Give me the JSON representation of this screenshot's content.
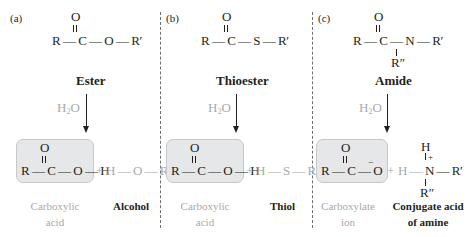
{
  "panels": [
    {
      "label": "(a)",
      "reactant": {
        "formula": "R — C — O — R′",
        "carbonyl_o": "O",
        "name": "Ester"
      },
      "reagent": "H2O",
      "product1": {
        "formula": "R — C — O — H",
        "carbonyl_o": "O",
        "name_line1": "Carboxylic",
        "name_line2": "acid"
      },
      "plus": "+",
      "product2": {
        "formula": "H — O — R′",
        "name": "Alcohol"
      }
    },
    {
      "label": "(b)",
      "reactant": {
        "formula": "R — C — S — R′",
        "carbonyl_o": "O",
        "name": "Thioester"
      },
      "reagent": "H2O",
      "product1": {
        "formula": "R — C — O — H",
        "carbonyl_o": "O",
        "name_line1": "Carboxylic",
        "name_line2": "acid"
      },
      "plus": "+",
      "product2": {
        "formula": "H — S — R′",
        "name": "Thiol"
      }
    },
    {
      "label": "(c)",
      "reactant": {
        "formula": "R — C — N — R′",
        "carbonyl_o": "O",
        "n_sub": "R″",
        "name": "Amide"
      },
      "reagent": "H2O",
      "product1": {
        "formula": "R — C — O",
        "charge": "−",
        "carbonyl_o": "O",
        "name_line1": "Carboxylate",
        "name_line2": "ion"
      },
      "plus": "+",
      "product2": {
        "formula": "H — N — R′",
        "top_h": "H",
        "charge": "+",
        "n_sub": "R″",
        "name_line1": "Conjugate acid",
        "name_line2": "of amine"
      }
    }
  ],
  "colors": {
    "text": "#231f20",
    "muted": "#a7a9ac",
    "box_fill": "#e6e7e8",
    "divider": "#6d6e71"
  }
}
